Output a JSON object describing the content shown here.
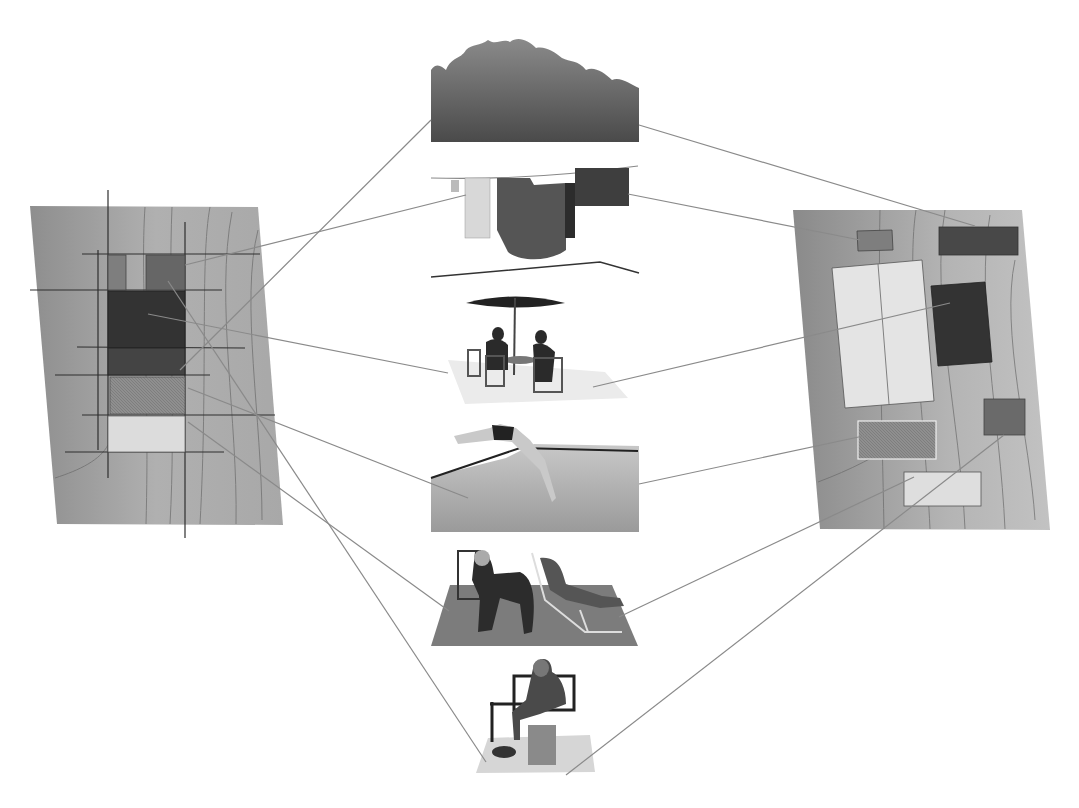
{
  "diagram": {
    "title": "",
    "style": "grayscale collage",
    "colors": {
      "background": "#ffffff",
      "wood_plan": "#9c9c9c",
      "wood_grain": "#6e6e6e",
      "connector": "#8a8a8a",
      "dark_block": "#3a3a3a",
      "mid_block": "#707070",
      "light_block": "#e2e2e2",
      "hatched_block": "#8c8c8c"
    },
    "left_plan": {
      "name": "site plan A (grid overlay)",
      "blocks": [
        {
          "id": "L1",
          "tone": "mid",
          "label": ""
        },
        {
          "id": "L2",
          "tone": "mid-dark",
          "label": ""
        },
        {
          "id": "L3",
          "tone": "dark",
          "label": ""
        },
        {
          "id": "L4",
          "tone": "dark-2",
          "label": ""
        },
        {
          "id": "L5",
          "tone": "hatched",
          "label": ""
        },
        {
          "id": "L6",
          "tone": "light",
          "label": ""
        }
      ]
    },
    "right_plan": {
      "name": "site plan B (scattered)",
      "blocks": [
        {
          "id": "R1",
          "tone": "mid",
          "label": ""
        },
        {
          "id": "R2",
          "tone": "dark-2",
          "label": ""
        },
        {
          "id": "R3",
          "tone": "light",
          "label": ""
        },
        {
          "id": "R4",
          "tone": "dark",
          "label": ""
        },
        {
          "id": "R5",
          "tone": "hatched",
          "label": ""
        },
        {
          "id": "R6",
          "tone": "mid-dark",
          "label": ""
        },
        {
          "id": "R7",
          "tone": "light",
          "label": ""
        }
      ]
    },
    "vignettes": [
      {
        "id": "V1",
        "subject": "vegetation / shrubs"
      },
      {
        "id": "V2",
        "subject": "clothesline with laundry"
      },
      {
        "id": "V3",
        "subject": "people at table under parasol"
      },
      {
        "id": "V4",
        "subject": "person diving into pool"
      },
      {
        "id": "V5",
        "subject": "two people on deck chairs"
      },
      {
        "id": "V6",
        "subject": "person seated reading on bench"
      }
    ],
    "connections": [
      {
        "from": "L2",
        "to": "V2"
      },
      {
        "from": "L4",
        "to": "V1"
      },
      {
        "from": "L3",
        "to": "V3"
      },
      {
        "from": "L5",
        "to": "V4"
      },
      {
        "from": "L6",
        "to": "V5"
      },
      {
        "from": "L2",
        "to": "V6"
      },
      {
        "from": "V1",
        "to": "R2"
      },
      {
        "from": "V2",
        "to": "R1"
      },
      {
        "from": "V3",
        "to": "R4"
      },
      {
        "from": "V4",
        "to": "R5"
      },
      {
        "from": "V5",
        "to": "R7"
      },
      {
        "from": "V6",
        "to": "R6"
      }
    ]
  }
}
